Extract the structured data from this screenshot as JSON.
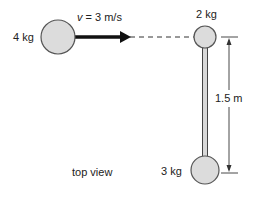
{
  "diagram": {
    "masses": [
      {
        "id": "m4",
        "label": "4 kg",
        "cx": 58,
        "cy": 37,
        "r": 17
      },
      {
        "id": "m2",
        "label": "2 kg",
        "cx": 205,
        "cy": 37,
        "r": 11
      },
      {
        "id": "m3",
        "label": "3 kg",
        "cx": 205,
        "cy": 170,
        "r": 14
      }
    ],
    "velocity": {
      "symbol": "v",
      "text": " = 3 m/s"
    },
    "dimension": {
      "label": "1.5 m"
    },
    "caption": "top view",
    "colors": {
      "ball_fill": "#dcdcdc",
      "ball_stroke": "#555555",
      "rod_fill": "#d8d8d8",
      "line": "#222222"
    }
  }
}
